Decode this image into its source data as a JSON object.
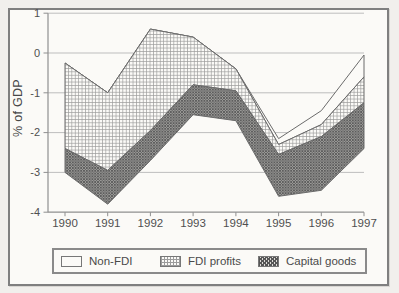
{
  "figure": {
    "y_axis_title": "% of GDP",
    "legend": [
      {
        "label": "Non-FDI",
        "swatch": "white"
      },
      {
        "label": "FDI profits",
        "swatch": "crosshatch"
      },
      {
        "label": "Capital goods",
        "swatch": "dark-diagonal-hatch"
      }
    ]
  },
  "chart_data": {
    "type": "area",
    "subtype": "stacked-bands",
    "title": "",
    "xlabel": "",
    "ylabel": "% of GDP",
    "x_tick_labels": [
      "1990",
      "1991",
      "1992",
      "1993",
      "1994",
      "1995",
      "1996",
      "1997"
    ],
    "y_ticks": [
      1,
      0,
      -1,
      -2,
      -3,
      -4
    ],
    "y_tick_labels": [
      "1",
      "0",
      "-1",
      "-2",
      "-3",
      "-4"
    ],
    "ylim": [
      -4,
      1
    ],
    "grid": true,
    "legend_position": "bottom",
    "series": [
      {
        "name": "Non-FDI",
        "values": [
          0,
          0,
          0,
          0,
          0,
          0.15,
          0.35,
          0.55
        ]
      },
      {
        "name": "FDI profits",
        "values": [
          2.15,
          1.95,
          2.55,
          1.2,
          0.55,
          0.25,
          0.3,
          0.65
        ]
      },
      {
        "name": "Capital goods",
        "values": [
          0.6,
          0.85,
          0.75,
          0.75,
          0.75,
          1.05,
          1.35,
          1.15
        ]
      }
    ],
    "boundaries": {
      "note": "percent of GDP; each band is drawn between successive boundary lines",
      "top_envelope": [
        -0.25,
        -1.0,
        0.6,
        0.4,
        -0.4,
        -2.15,
        -1.45,
        -0.05
      ],
      "fdi_profits_top": [
        -0.25,
        -1.0,
        0.6,
        0.4,
        -0.4,
        -2.3,
        -1.8,
        -0.6
      ],
      "capital_goods_top": [
        -2.4,
        -2.95,
        -1.95,
        -0.8,
        -0.95,
        -2.55,
        -2.1,
        -1.25
      ],
      "bottom_envelope": [
        -3.0,
        -3.8,
        -2.7,
        -1.55,
        -1.7,
        -3.6,
        -3.45,
        -2.4
      ]
    }
  },
  "colors": {
    "page_background": "#f1efec",
    "figure_background": "#fbfaf7",
    "figure_border": "#7f7f7f",
    "grid": "#bdbdbd",
    "axis": "#8f8f8f",
    "band_outline": "#6b6b6b",
    "hatch_light": "#9c9c9c",
    "hatch_dark": "#565656",
    "text": "#4f4f4f"
  }
}
